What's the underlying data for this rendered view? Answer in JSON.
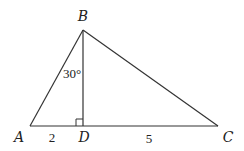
{
  "diagram": {
    "type": "geometry-triangle",
    "stroke_color": "#333333",
    "vertices": {
      "A": {
        "label": "A",
        "x": 30,
        "y": 126
      },
      "B": {
        "label": "B",
        "x": 83,
        "y": 30
      },
      "C": {
        "label": "C",
        "x": 218,
        "y": 126
      },
      "D": {
        "label": "D",
        "x": 83,
        "y": 126
      }
    },
    "angle_label": "30°",
    "segment_labels": {
      "AD": "2",
      "DC": "5"
    },
    "right_angle_at": "D"
  }
}
